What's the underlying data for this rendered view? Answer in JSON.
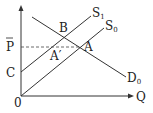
{
  "diagram": {
    "type": "supply-demand",
    "axes": {
      "y_label": "",
      "x_label": "Q",
      "origin_label": "0"
    },
    "curves": [
      {
        "id": "S1",
        "label": "S",
        "subscript": "1",
        "kind": "supply"
      },
      {
        "id": "S0",
        "label": "S",
        "subscript": "0",
        "kind": "supply"
      },
      {
        "id": "D0",
        "label": "D",
        "subscript": "0",
        "kind": "demand"
      }
    ],
    "points": {
      "B": "B",
      "A": "A",
      "A_prime": "A′",
      "C": "C"
    },
    "price_level": {
      "label": "P",
      "overbar": true,
      "line_style": "dashed"
    },
    "colors": {
      "line": "#333333",
      "text": "#222222",
      "dashed": "#444444"
    }
  }
}
